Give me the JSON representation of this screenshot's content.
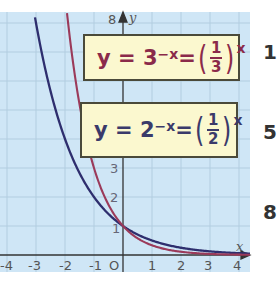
{
  "chart_data": {
    "type": "line",
    "title": "",
    "xlabel": "x",
    "ylabel": "y",
    "xlim": [
      -4.2,
      4.3
    ],
    "ylim": [
      0,
      8.2
    ],
    "grid": true,
    "x_ticks": [
      "-4",
      "-3",
      "-2",
      "-1",
      "O",
      "1",
      "2",
      "3",
      "4"
    ],
    "y_ticks": [
      "1",
      "2",
      "3",
      "8"
    ],
    "series": [
      {
        "name": "y = 3^-x = (1/3)^x",
        "color": "#9b3a5a",
        "x": [
          -1.9,
          -1.5,
          -1,
          -0.5,
          0,
          0.5,
          1,
          2,
          3,
          4
        ],
        "values": [
          8.06,
          5.2,
          3,
          1.73,
          1,
          0.58,
          0.33,
          0.11,
          0.04,
          0.01
        ]
      },
      {
        "name": "y = 2^-x = (1/2)^x",
        "color": "#2e2e6e",
        "x": [
          -3,
          -2.5,
          -2,
          -1.5,
          -1,
          -0.5,
          0,
          1,
          2,
          3,
          4
        ],
        "values": [
          8,
          5.66,
          4,
          2.83,
          2,
          1.41,
          1,
          0.5,
          0.25,
          0.13,
          0.06
        ]
      }
    ],
    "annotations": [
      "y = 3^-x = (1/3)^x",
      "y = 2^-x = (1/2)^x"
    ]
  },
  "labels": {
    "y_axis": "y",
    "x_axis": "x",
    "origin": "O",
    "top_tick": "8",
    "y1": "1",
    "y2": "2",
    "y3": "3",
    "xm4": "-4",
    "xm3": "-3",
    "xm2": "-2",
    "xm1": "-1",
    "x1": "1",
    "x2": "2",
    "x3": "3",
    "x4": "4"
  },
  "boxes": {
    "red": {
      "lhs": "y = 3",
      "exp": "−x",
      "eq": " =",
      "num": "1",
      "den": "3",
      "outer_exp": "x"
    },
    "blue": {
      "lhs": "y = 2",
      "exp": "−x",
      "eq": " =",
      "num": "1",
      "den": "2",
      "outer_exp": "x"
    }
  },
  "side_marks": [
    "1",
    "5",
    "8"
  ]
}
